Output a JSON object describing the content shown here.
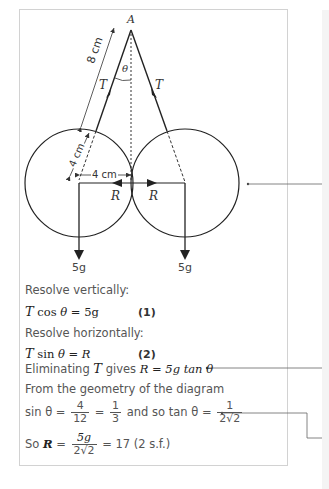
{
  "diagram": {
    "point_label": "A",
    "angle_label": "θ",
    "tension_label_left": "T",
    "tension_label_right": "T",
    "string_length_label": "8 cm",
    "radius_label": "4 cm",
    "half_separation_label": "4 cm",
    "reaction_label_left": "R",
    "reaction_label_right": "R",
    "weight_label_left": "5g",
    "weight_label_right": "5g"
  },
  "working": {
    "line1": "Resolve vertically:",
    "eq1_lhs": "T",
    "eq1_func": "cos",
    "eq1_theta": "θ",
    "eq1_rhs": " = 5g",
    "eq1_tag": "(1)",
    "line2": "Resolve horizontally:",
    "eq2_lhs": "T",
    "eq2_func": "sin",
    "eq2_theta": "θ",
    "eq2_rhs": " = R",
    "eq2_tag": "(2)",
    "line3_text": "Eliminating ",
    "line3_T": "T",
    "line3_mid": " gives ",
    "line3_expr": "R = 5g tan θ",
    "line4": "From the geometry of the diagram",
    "line5_start": "sin θ =",
    "frac1_num": "4",
    "frac1_den": "12",
    "frac2_num": "1",
    "frac2_den": "3",
    "line5_mid": " and so tan θ =",
    "frac3_num": "1",
    "frac3_den": "2√2",
    "line6_start": "So ",
    "line6_R": "R",
    "line6_eq": " =",
    "frac4_num": "5g",
    "frac4_den": "2√2",
    "line6_end": "= 17 (2 s.f.)"
  }
}
